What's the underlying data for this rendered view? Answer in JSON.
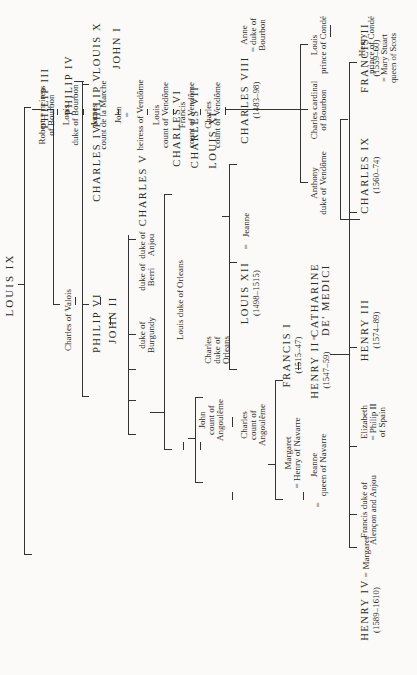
{
  "diagram": {
    "type": "genealogical-table",
    "orientation": "rotated-90-ccw",
    "root": "LOUIS IX",
    "nodes": {
      "louis_ix": "LOUIS IX",
      "philip_iii": "PHILIP III",
      "charles_valois": "Charles of Valois",
      "philip_iv": "PHILIP IV",
      "philip_vi": "PHILIP VI",
      "john_ii": "JOHN II",
      "louis_x": "LOUIS X",
      "philip_v": "PHILIP V",
      "charles_iv": "CHARLES IV",
      "john_i": "JOHN I",
      "charles_v": "CHARLES V",
      "anjou": [
        "duke of",
        "Anjou"
      ],
      "berri": [
        "duke of",
        "Berri"
      ],
      "burgundy": [
        "duke of",
        "Burgundy"
      ],
      "charles_vi": "CHARLES VI",
      "louis_orleans": "Louis duke of Orleans",
      "charles_vii": "CHARLES VII",
      "louis_xi": "LOUIS XI",
      "charles_orleans": [
        "Charles",
        "duke of",
        "Orleans"
      ],
      "john_angouleme": [
        "John",
        "count of",
        "Angoulême"
      ],
      "charles_angouleme": [
        "Charles",
        "count of",
        "Angoulême"
      ],
      "anne": [
        "Anne",
        "= duke of",
        "Bourbon"
      ],
      "charles_viii": {
        "name": "CHARLES VIII",
        "dates": "(1483–98)"
      },
      "jeanne": "Jeanne",
      "marriage_sign": "=",
      "louis_xii": {
        "name": "LOUIS XII",
        "dates": "(1498–1515)"
      },
      "francis_i": {
        "name": "FRANCIS I",
        "dates": "(1515–47)"
      },
      "margaret_navarre": [
        "Margaret",
        "= Henry of Navarre"
      ],
      "catharine": [
        "CATHARINE",
        "DE' MEDICI"
      ],
      "henry_ii": {
        "name": "HENRY II",
        "dates": "(1547–59)"
      },
      "jeanne_navarre": [
        "Jeanne",
        "queen of Navarre"
      ],
      "francis_ii": {
        "name": "FRANCIS II",
        "dates": "(1559–60)",
        "spouse": [
          "= Mary Stuart",
          "queen of Scots"
        ]
      },
      "charles_ix": {
        "name": "CHARLES IX",
        "dates": "(1560–74)"
      },
      "henry_iii": {
        "name": "HENRY III",
        "dates": "(1574–89)"
      },
      "elizabeth": [
        "Elizabeth",
        "= Philip II",
        "of Spain"
      ],
      "francis_alencon": [
        "Francis duke of",
        "Alençon and Anjou"
      ],
      "margaret_valois": "Margaret",
      "henry_iv": {
        "name": "HENRY IV",
        "dates": "(1589–1610)"
      },
      "robert": [
        "Robert = heiress",
        "of Bourbon"
      ],
      "louis_bourbon": [
        "Louis",
        "duke of Bourbon"
      ],
      "james_marche": [
        "James",
        "count de la Marche"
      ],
      "john_vendome": [
        "John",
        "="
      ],
      "heiress_vendome": "heiress of Vendôme",
      "louis_vendome": [
        "Louis",
        "count of Vendôme"
      ],
      "francis_vendome": [
        "Francis",
        "count of Vendôme"
      ],
      "charles_vendome": [
        "Charles",
        "count of Vendôme"
      ],
      "anthony": [
        "Anthony",
        "duke of Vendôme"
      ],
      "charles_cardinal": [
        "Charles cardinal",
        "of Bourbon"
      ],
      "louis_conde": [
        "Louis",
        "prince of Condé"
      ],
      "henry_conde": [
        "Henry",
        "prince of Condé"
      ]
    }
  }
}
